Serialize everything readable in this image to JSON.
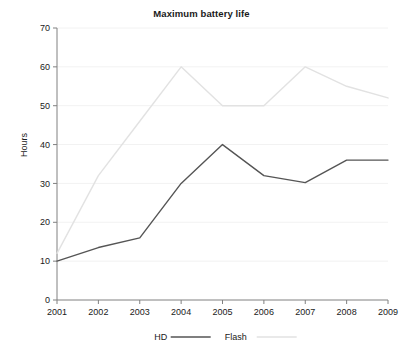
{
  "chart_data": {
    "type": "line",
    "title": "Maximum battery life",
    "xlabel": "",
    "ylabel": "Hours",
    "categories": [
      "2001",
      "2002",
      "2003",
      "2004",
      "2005",
      "2006",
      "2007",
      "2008",
      "2009"
    ],
    "x": [
      2001,
      2002,
      2003,
      2004,
      2005,
      2006,
      2007,
      2008,
      2009
    ],
    "ylim": [
      0,
      70
    ],
    "yticks": [
      0,
      10,
      20,
      30,
      40,
      50,
      60,
      70
    ],
    "grid": true,
    "grid_axis": "y",
    "legend_position": "bottom-center",
    "series": [
      {
        "name": "HD",
        "color": "#555555",
        "values": [
          10,
          13.5,
          16,
          30,
          40,
          32,
          30.2,
          36,
          36
        ]
      },
      {
        "name": "Flash",
        "color": "#e2e2e2",
        "values": [
          12,
          32,
          46,
          60,
          50,
          50,
          60,
          55,
          52
        ]
      }
    ]
  },
  "legend": {
    "items": [
      {
        "label": "HD",
        "color": "#555555"
      },
      {
        "label": "Flash",
        "color": "#e2e2e2"
      }
    ]
  },
  "axes": {
    "axis_color": "#808080",
    "grid_color": "#f2f2f2",
    "text_color": "#1a1a1a"
  },
  "background": "#ffffff"
}
